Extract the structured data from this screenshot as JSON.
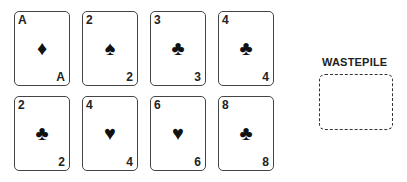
{
  "tableau": {
    "rows": [
      [
        {
          "rank": "A",
          "suit": "diamonds",
          "symbol": "♦"
        },
        {
          "rank": "2",
          "suit": "spades",
          "symbol": "♠"
        },
        {
          "rank": "3",
          "suit": "clubs",
          "symbol": "♣"
        },
        {
          "rank": "4",
          "suit": "clubs",
          "symbol": "♣"
        }
      ],
      [
        {
          "rank": "2",
          "suit": "clubs",
          "symbol": "♣"
        },
        {
          "rank": "4",
          "suit": "hearts",
          "symbol": "♥"
        },
        {
          "rank": "6",
          "suit": "hearts",
          "symbol": "♥"
        },
        {
          "rank": "8",
          "suit": "clubs",
          "symbol": "♣"
        }
      ]
    ]
  },
  "wastepile": {
    "label": "WASTEPILE"
  }
}
